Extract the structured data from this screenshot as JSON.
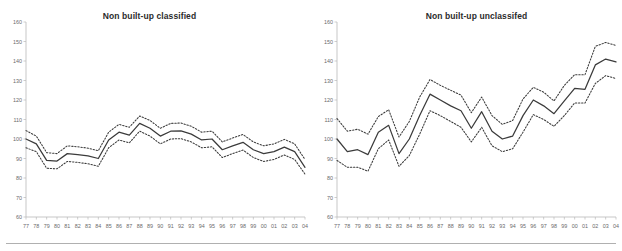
{
  "figure": {
    "background_color": "#ffffff",
    "line_color": "#3b3b3b",
    "axis_color": "#b9b9b9",
    "tick_label_color": "#6a6a6a",
    "footer_rule_color": "#b0b0b0"
  },
  "panels": [
    {
      "title": "Non built-up classified"
    },
    {
      "title": "Non built-up unclassifed"
    }
  ],
  "chart_data": [
    {
      "type": "line",
      "title": "Non built-up classified",
      "xlabel": "",
      "ylabel": "",
      "xlim": [
        0,
        27
      ],
      "ylim": [
        60,
        160
      ],
      "ytick_values": [
        60,
        70,
        80,
        90,
        100,
        110,
        120,
        130,
        140,
        150,
        160
      ],
      "ytick_labels": [
        "60",
        "70",
        "80",
        "90",
        "100",
        "110",
        "120",
        "130",
        "140",
        "150",
        "160"
      ],
      "grid": false,
      "legend": "none",
      "categories": [
        "77",
        "78",
        "79",
        "80",
        "81",
        "82",
        "83",
        "84",
        "85",
        "86",
        "87",
        "88",
        "89",
        "90",
        "91",
        "92",
        "93",
        "94",
        "95",
        "96",
        "97",
        "98",
        "99",
        "00",
        "01",
        "02",
        "03",
        "04"
      ],
      "series": [
        {
          "name": "index",
          "style": "solid",
          "values": [
            100.0,
            97.5,
            89.0,
            88.7,
            92.5,
            92.0,
            91.3,
            90.0,
            99.5,
            103.5,
            102.0,
            108.0,
            105.5,
            101.5,
            104.0,
            104.2,
            102.5,
            99.5,
            100.0,
            94.5,
            96.5,
            98.3,
            94.5,
            92.5,
            93.5,
            95.8,
            93.5,
            85.5
          ]
        },
        {
          "name": "upper confidence bound",
          "style": "dotted",
          "values": [
            104.3,
            101.5,
            93.0,
            92.5,
            96.5,
            96.0,
            95.3,
            94.0,
            103.5,
            107.5,
            106.0,
            111.8,
            109.5,
            105.5,
            108.0,
            108.2,
            106.5,
            103.5,
            104.0,
            98.5,
            100.5,
            102.3,
            98.5,
            96.5,
            97.5,
            99.8,
            97.5,
            89.5
          ]
        },
        {
          "name": "lower confidence bound",
          "style": "dotted",
          "values": [
            95.5,
            93.5,
            85.0,
            84.7,
            88.5,
            88.0,
            87.3,
            86.0,
            95.5,
            99.5,
            98.0,
            104.0,
            101.5,
            97.5,
            100.0,
            100.2,
            98.5,
            95.5,
            96.0,
            90.5,
            92.5,
            94.3,
            90.5,
            88.5,
            89.5,
            91.8,
            89.5,
            82.0
          ]
        }
      ]
    },
    {
      "type": "line",
      "title": "Non built-up unclassifed",
      "xlabel": "",
      "ylabel": "",
      "xlim": [
        0,
        27
      ],
      "ylim": [
        60,
        160
      ],
      "ytick_values": [
        60,
        70,
        80,
        90,
        100,
        110,
        120,
        130,
        140,
        150,
        160
      ],
      "ytick_labels": [
        "60",
        "70",
        "80",
        "90",
        "100",
        "110",
        "120",
        "130",
        "140",
        "150",
        "160"
      ],
      "grid": false,
      "legend": "none",
      "categories": [
        "77",
        "78",
        "79",
        "80",
        "81",
        "82",
        "83",
        "84",
        "85",
        "86",
        "87",
        "88",
        "89",
        "90",
        "91",
        "92",
        "93",
        "94",
        "95",
        "96",
        "97",
        "98",
        "99",
        "00",
        "01",
        "02",
        "03",
        "04"
      ],
      "series": [
        {
          "name": "index",
          "style": "solid",
          "values": [
            100.0,
            93.5,
            94.5,
            92.0,
            103.5,
            107.0,
            92.5,
            100.0,
            112.0,
            123.0,
            120.0,
            117.0,
            114.5,
            105.5,
            114.0,
            104.0,
            100.0,
            101.5,
            112.0,
            120.0,
            117.0,
            113.0,
            119.5,
            126.0,
            125.5,
            138.0,
            141.0,
            139.5
          ]
        },
        {
          "name": "upper confidence bound",
          "style": "dotted",
          "values": [
            110.5,
            104.0,
            105.0,
            102.5,
            111.5,
            115.0,
            101.0,
            109.0,
            121.5,
            130.5,
            127.5,
            125.0,
            122.5,
            113.5,
            121.5,
            112.0,
            107.5,
            109.5,
            120.5,
            126.5,
            124.0,
            119.5,
            127.5,
            133.0,
            133.0,
            147.5,
            149.5,
            148.0
          ]
        },
        {
          "name": "lower confidence bound",
          "style": "dotted",
          "values": [
            89.0,
            85.5,
            85.5,
            83.5,
            95.0,
            99.5,
            86.0,
            91.5,
            102.5,
            114.5,
            112.0,
            109.0,
            106.0,
            98.5,
            106.0,
            96.5,
            93.5,
            95.0,
            103.5,
            112.5,
            110.0,
            106.5,
            112.0,
            118.5,
            118.5,
            128.5,
            132.5,
            131.0
          ]
        }
      ]
    }
  ]
}
